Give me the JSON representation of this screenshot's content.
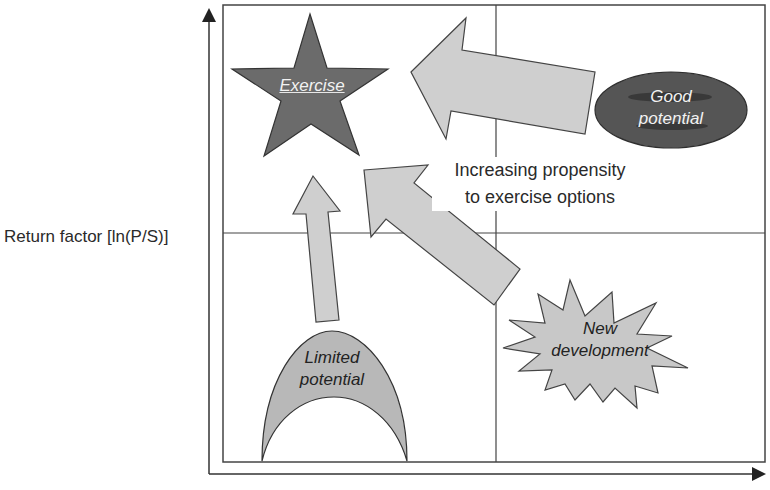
{
  "axes": {
    "y_label": "Return factor [ln(P/S)]",
    "x_label": ""
  },
  "caption": {
    "line1": "Increasing propensity",
    "line2": "to exercise options"
  },
  "quadrants": {
    "top_left": {
      "label": "Exercise",
      "shape": "star",
      "fill": "#6b6b6b"
    },
    "top_right": {
      "label_line1": "Good",
      "label_line2": "potential",
      "shape": "ellipse",
      "fill": "#5a5a5a"
    },
    "bottom_left": {
      "label_line1": "Limited",
      "label_line2": "potential",
      "shape": "arch",
      "fill": "#b8b8b8"
    },
    "bottom_right": {
      "label_line1": "New",
      "label_line2": "development",
      "shape": "starburst",
      "fill": "#c8c8c8"
    }
  },
  "arrows": [
    {
      "from": "Good potential",
      "to": "Exercise",
      "direction": "left"
    },
    {
      "from": "New development",
      "to": "Exercise",
      "direction": "up-left"
    },
    {
      "from": "Limited potential",
      "to": "Exercise",
      "direction": "up"
    }
  ],
  "colors": {
    "line": "#4a4a4a",
    "arrow_fill": "#cfcfcf",
    "background": "#ffffff"
  }
}
